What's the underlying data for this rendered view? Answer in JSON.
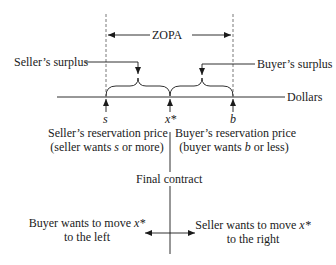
{
  "diagram": {
    "zopa_label": "ZOPA",
    "sellers_surplus_label": "Seller’s surplus",
    "buyers_surplus_label": "Buyer’s surplus",
    "axis_label": "Dollars",
    "points": {
      "s": "s",
      "x_star": "x*",
      "b": "b"
    },
    "sellers_reservation": {
      "line1": "Seller’s reservation price",
      "line2_prefix": "(seller wants ",
      "line2_var": "s",
      "line2_suffix": " or more)"
    },
    "buyers_reservation": {
      "line1": "Buyer’s reservation price",
      "line2_prefix": "(buyer wants ",
      "line2_var": "b",
      "line2_suffix": " or less)"
    },
    "final_contract_label": "Final contract",
    "buyer_move": {
      "line1_prefix": "Buyer wants to move ",
      "line1_var": "x*",
      "line2": "to the left"
    },
    "seller_move": {
      "line1_prefix": "Seller wants to move ",
      "line1_var": "x*",
      "line2": "to the right"
    },
    "colors": {
      "ink": "#1a1a1a",
      "dashed": "#555555"
    }
  }
}
